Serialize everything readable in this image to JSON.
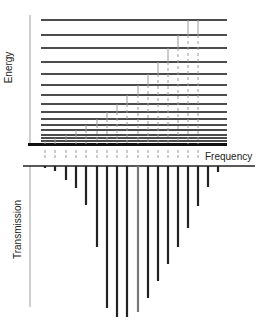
{
  "labels": {
    "energy": "Energy",
    "transmission": "Transmission",
    "frequency": "Frequency"
  },
  "colors": {
    "level_line": "#111111",
    "transition_line": "#9a9a9a",
    "axis_line": "#a0a0a0",
    "spike": "#222222"
  },
  "energy_diagram": {
    "x_start": 41,
    "x_end": 227,
    "levels_y": [
      20,
      35,
      48,
      62,
      74,
      85,
      95,
      104,
      112,
      119,
      125,
      130,
      135,
      138,
      141
    ],
    "ground_y": 144,
    "transition_x": [
      45,
      55,
      66,
      76,
      86,
      97,
      107,
      117,
      127,
      138,
      148,
      158,
      168,
      178,
      188,
      198
    ]
  },
  "transmission_spectrum": {
    "baseline_y": 166,
    "x_start": 23,
    "x_end": 255,
    "spikes": [
      {
        "x": 45,
        "depth_y": 168
      },
      {
        "x": 55,
        "depth_y": 171
      },
      {
        "x": 66,
        "depth_y": 180
      },
      {
        "x": 76,
        "depth_y": 188
      },
      {
        "x": 86,
        "depth_y": 205
      },
      {
        "x": 97,
        "depth_y": 247
      },
      {
        "x": 107,
        "depth_y": 308
      },
      {
        "x": 117,
        "depth_y": 317
      },
      {
        "x": 127,
        "depth_y": 317
      },
      {
        "x": 138,
        "depth_y": 312
      },
      {
        "x": 148,
        "depth_y": 298
      },
      {
        "x": 158,
        "depth_y": 281
      },
      {
        "x": 168,
        "depth_y": 264
      },
      {
        "x": 178,
        "depth_y": 247
      },
      {
        "x": 188,
        "depth_y": 228
      },
      {
        "x": 198,
        "depth_y": 206
      },
      {
        "x": 208,
        "depth_y": 187
      },
      {
        "x": 218,
        "depth_y": 172
      }
    ]
  }
}
